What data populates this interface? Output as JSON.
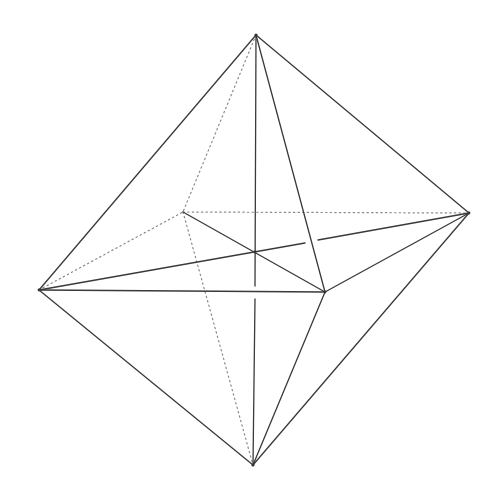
{
  "diagram": {
    "vertices": {
      "top": [
        256,
        35
      ],
      "bottom": [
        253,
        465
      ],
      "left": [
        39,
        290
      ],
      "right": [
        469,
        213
      ],
      "front": [
        325,
        292
      ],
      "back": [
        183,
        212
      ],
      "center": [
        255,
        252
      ]
    },
    "colors": {
      "background": "#ffffff",
      "solid_edge": "#3a3a3a",
      "hidden_edge": "#8a8a8a"
    }
  }
}
